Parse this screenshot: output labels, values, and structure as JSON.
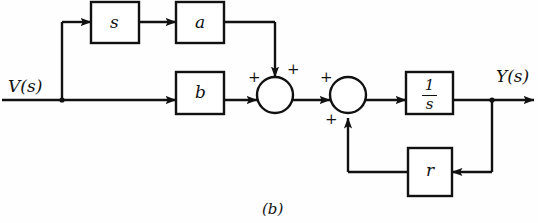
{
  "figure": {
    "caption": "(b)",
    "stroke_color": "#111111",
    "background_color": "#fefefe"
  },
  "signals": {
    "input_label": "V(s)",
    "output_label": "Y(s)"
  },
  "blocks": [
    {
      "id": "s-block",
      "label": "s",
      "x": 91,
      "y": 2,
      "w": 48,
      "h": 41
    },
    {
      "id": "a-block",
      "label": "a",
      "x": 176,
      "y": 2,
      "w": 48,
      "h": 41
    },
    {
      "id": "b-block",
      "label": "b",
      "x": 176,
      "y": 72,
      "w": 48,
      "h": 42
    },
    {
      "id": "integrator-block",
      "numerator": "1",
      "denominator": "s",
      "x": 406,
      "y": 72,
      "w": 47,
      "h": 42
    },
    {
      "id": "r-block",
      "label": "r",
      "x": 408,
      "y": 148,
      "w": 44,
      "h": 48
    }
  ],
  "summing_junctions": [
    {
      "id": "summer-1",
      "cx": 275,
      "cy": 95,
      "r": 18,
      "signs": [
        {
          "label": "+",
          "position": "left",
          "x": 248,
          "y": 72
        },
        {
          "label": "+",
          "position": "top-right",
          "x": 287,
          "y": 64
        }
      ]
    },
    {
      "id": "summer-2",
      "cx": 348,
      "cy": 95,
      "r": 18,
      "signs": [
        {
          "label": "+",
          "position": "left",
          "x": 320,
          "y": 72
        },
        {
          "label": "+",
          "position": "bottom-left",
          "x": 325,
          "y": 113
        }
      ]
    }
  ],
  "paths": {
    "input_trunk": "V(s) enters at left, runs right along y=100 to the b block",
    "branch_node": {
      "x": 62,
      "y": 100
    },
    "derivative_path": "branch rises to y=22 then right into s block, through a block, right to x=275, down into summer-1",
    "feedback_path": "output branches at x=492 down to y=172, left into r block, out left to x=348, up into summer-2"
  }
}
